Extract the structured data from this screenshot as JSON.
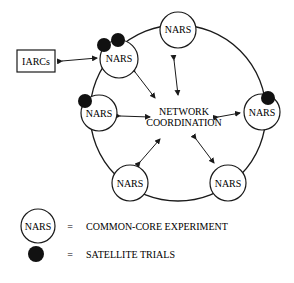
{
  "diagram": {
    "node_label": "NARS",
    "external_box": "IARCs",
    "center_line1": "NETWORK",
    "center_line2": "COORDINATION",
    "nodes": [
      {
        "id": "top",
        "label": "NARS",
        "satellites": 0
      },
      {
        "id": "upper-left",
        "label": "NARS",
        "satellites": 2
      },
      {
        "id": "left",
        "label": "NARS",
        "satellites": 1
      },
      {
        "id": "right",
        "label": "NARS",
        "satellites": 1
      },
      {
        "id": "lower-left",
        "label": "NARS",
        "satellites": 0
      },
      {
        "id": "lower-right",
        "label": "NARS",
        "satellites": 0
      }
    ]
  },
  "legend": {
    "circle_label": "NARS",
    "equals": "=",
    "circle_meaning": "COMMON-CORE EXPERIMENT",
    "dot_meaning": "SATELLITE TRIALS"
  },
  "colors": {
    "stroke": "#1a1a1a",
    "fill": "#ffffff",
    "dot": "#111111"
  }
}
